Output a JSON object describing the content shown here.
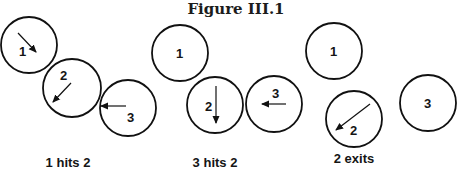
{
  "figure": {
    "title": "Figure III.1",
    "corner_mark": "g"
  },
  "panels": [
    {
      "caption": "1 hits 2",
      "balls": [
        {
          "label": "1",
          "cx": 29,
          "cy": 45,
          "r": 28,
          "lx": 19,
          "ly": 56,
          "arrow": {
            "x1": 18,
            "y1": 33,
            "x2": 36,
            "y2": 52
          }
        },
        {
          "label": "2",
          "cx": 72,
          "cy": 88,
          "r": 29,
          "lx": 60,
          "ly": 80,
          "arrow": {
            "x1": 71,
            "y1": 83,
            "x2": 53,
            "y2": 102
          }
        },
        {
          "label": "3",
          "cx": 128,
          "cy": 108,
          "r": 28,
          "lx": 127,
          "ly": 122,
          "arrow": {
            "x1": 126,
            "y1": 106,
            "x2": 101,
            "y2": 106
          }
        }
      ]
    },
    {
      "caption": "3 hits 2",
      "balls": [
        {
          "label": "1",
          "cx": 180,
          "cy": 53,
          "r": 28,
          "lx": 176,
          "ly": 58,
          "arrow": null
        },
        {
          "label": "2",
          "cx": 215,
          "cy": 105,
          "r": 28,
          "lx": 205,
          "ly": 111,
          "arrow": {
            "x1": 216,
            "y1": 86,
            "x2": 216,
            "y2": 123
          }
        },
        {
          "label": "3",
          "cx": 274,
          "cy": 104,
          "r": 28,
          "lx": 272,
          "ly": 98,
          "arrow": {
            "x1": 286,
            "y1": 104,
            "x2": 262,
            "y2": 104
          }
        }
      ]
    },
    {
      "caption": "2 exits",
      "balls": [
        {
          "label": "1",
          "cx": 334,
          "cy": 51,
          "r": 28,
          "lx": 330,
          "ly": 56,
          "arrow": null
        },
        {
          "label": "2",
          "cx": 354,
          "cy": 119,
          "r": 28,
          "lx": 350,
          "ly": 135,
          "arrow": {
            "x1": 370,
            "y1": 104,
            "x2": 336,
            "y2": 130
          }
        },
        {
          "label": "3",
          "cx": 428,
          "cy": 103,
          "r": 28,
          "lx": 424,
          "ly": 108,
          "arrow": null
        }
      ]
    }
  ],
  "captions_pos": [
    {
      "x": 68,
      "y": 167
    },
    {
      "x": 215,
      "y": 167
    },
    {
      "x": 354,
      "y": 163
    }
  ],
  "colors": {
    "ink": "#111111",
    "background": "#ffffff"
  }
}
